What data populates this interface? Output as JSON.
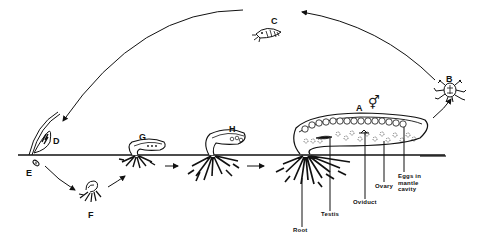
{
  "diagram": {
    "type": "life-cycle",
    "colors": {
      "ink": "#111111",
      "background": "#ffffff"
    },
    "stages": [
      {
        "id": "A",
        "label": "A",
        "description": "adult externa on host"
      },
      {
        "id": "B",
        "label": "B",
        "description": "nauplius larva"
      },
      {
        "id": "C",
        "label": "C",
        "description": "cypris larva"
      },
      {
        "id": "D",
        "label": "D",
        "description": "cyprid attached to host seta"
      },
      {
        "id": "E",
        "label": "E",
        "description": "kentrogon / injected stage"
      },
      {
        "id": "F",
        "label": "F",
        "description": "internal developing rootlets"
      },
      {
        "id": "G",
        "label": "G",
        "description": "young externa"
      },
      {
        "id": "H",
        "label": "H",
        "description": "maturing externa"
      }
    ],
    "sex_symbol": "⚥",
    "annotations": [
      {
        "id": "root",
        "label": "Root"
      },
      {
        "id": "testis",
        "label": "Testis"
      },
      {
        "id": "oviduct",
        "label": "Oviduct"
      },
      {
        "id": "ovary",
        "label": "Ovary"
      },
      {
        "id": "eggs",
        "label": "Eggs in\nmantle\ncavity"
      }
    ]
  }
}
